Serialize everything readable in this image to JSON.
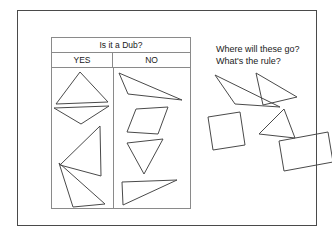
{
  "slide": {
    "width": 334,
    "height": 239,
    "background_color": "#ffffff",
    "frame_color": "#4a4a4a",
    "line_color": "#4a4a4a",
    "table_border_color": "#8a8a8a",
    "text_color": "#1a1a1a"
  },
  "table": {
    "title": "Is it a Dub?",
    "columns": [
      {
        "label": "YES",
        "name": "yes"
      },
      {
        "label": "NO",
        "name": "no"
      }
    ],
    "yes_shapes": [
      {
        "name": "wide-flat-triangle-up",
        "kind": "triangle",
        "sides": 3,
        "points": "4,36 28,4 56,34"
      },
      {
        "name": "thin-triangle-down",
        "kind": "triangle",
        "sides": 3,
        "points": "2,40 57,38 29,56"
      },
      {
        "name": "left-pointing-triangle",
        "kind": "triangle",
        "sides": 3,
        "points": "48,58 49,108 8,97"
      },
      {
        "name": "large-scalene-triangle",
        "kind": "triangle",
        "sides": 3,
        "points": "7,95 53,136 21,139"
      }
    ],
    "no_shapes": [
      {
        "name": "thin-obtuse-triangle",
        "kind": "triangle-thin",
        "sides": 3,
        "points": "5,5 68,32 14,26"
      },
      {
        "name": "parallelogram",
        "kind": "quadrilateral",
        "sides": 4,
        "points": "22,41 54,39 44,66 13,64"
      },
      {
        "name": "downward-triangle",
        "kind": "triangle",
        "sides": 3,
        "points": "13,75 49,71 30,106"
      },
      {
        "name": "thin-right-triangle",
        "kind": "triangle-thin",
        "sides": 3,
        "points": "8,114 63,112 9,137"
      }
    ]
  },
  "prompt": {
    "line1": "Where will these go?",
    "line2": "What's the rule?"
  },
  "loose_shapes": [
    {
      "name": "thin-triangle-pointing-left",
      "kind": "triangle-thin",
      "sides": 3,
      "points": "11,6 76,38 31,35"
    },
    {
      "name": "triangle-pointing-right",
      "kind": "triangle",
      "sides": 3,
      "points": "52,4 93,28 59,36"
    },
    {
      "name": "tilted-square",
      "kind": "quadrilateral",
      "sides": 4,
      "points": "4,48 36,43 41,76 9,81"
    },
    {
      "name": "slim-triangle-middle",
      "kind": "triangle",
      "sides": 3,
      "points": "80,40 91,69 55,65"
    },
    {
      "name": "tilted-rectangle",
      "kind": "quadrilateral",
      "sides": 4,
      "points": "75,72 124,63 129,93 80,102"
    }
  ]
}
